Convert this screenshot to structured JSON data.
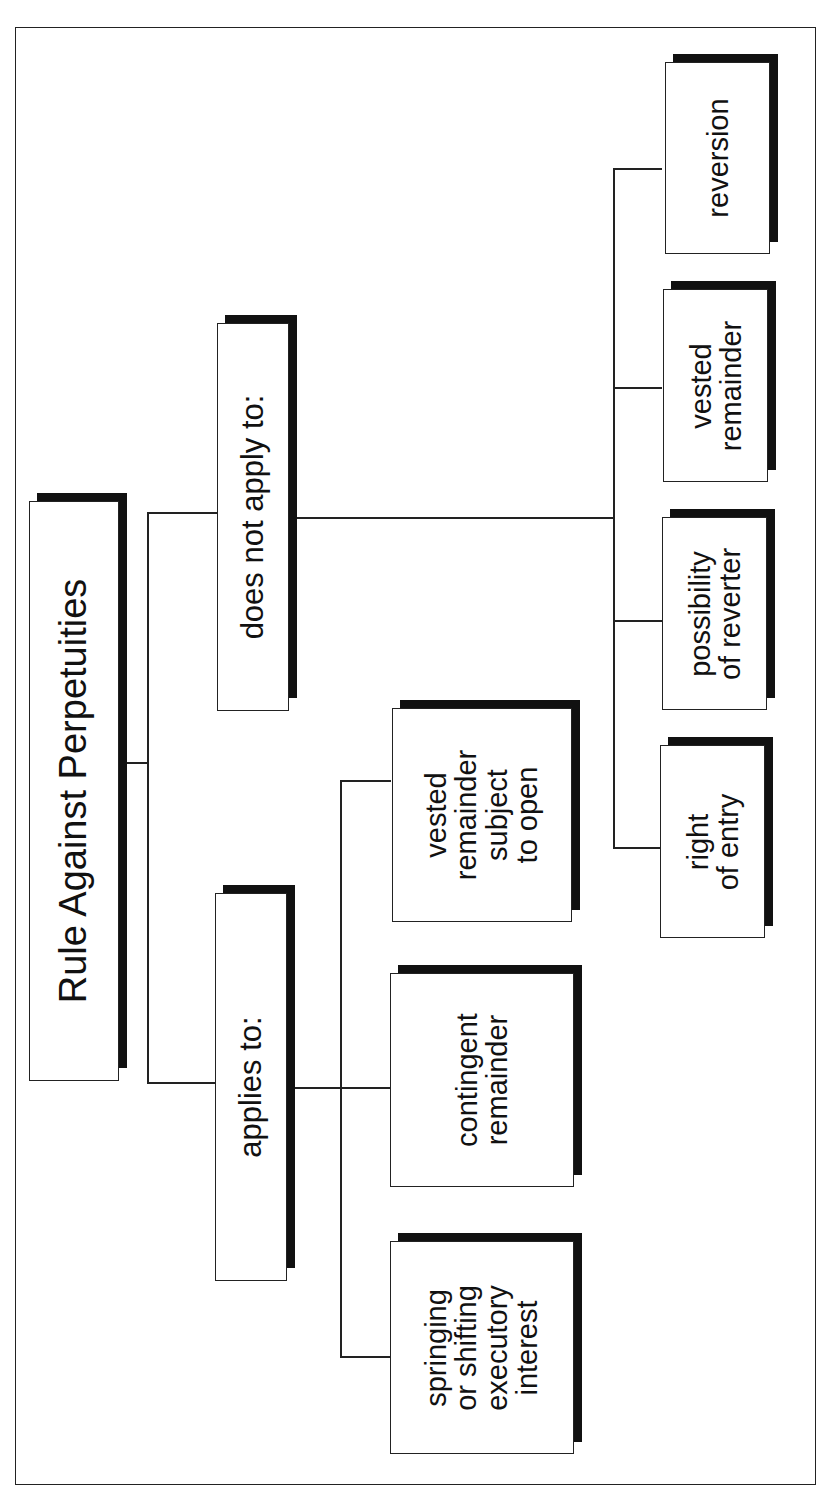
{
  "diagram": {
    "orientation": "rotated-90-ccw",
    "root": {
      "label": "Rule Against Perpetuities"
    },
    "branches": [
      {
        "label": "applies to:",
        "children": [
          {
            "label": "vested\nremainder\nsubject\nto open"
          },
          {
            "label": "contingent\nremainder"
          },
          {
            "label": "springing\nor shifting\nexecutory\ninterest"
          }
        ]
      },
      {
        "label": "does not apply to:",
        "children": [
          {
            "label": "right\nof entry"
          },
          {
            "label": "possibility\nof reverter"
          },
          {
            "label": "vested\nremainder"
          },
          {
            "label": "reversion"
          }
        ]
      }
    ]
  },
  "colors": {
    "line": "#222222",
    "shadow": "#111111",
    "box_fill": "#ffffff",
    "text": "#111111"
  }
}
